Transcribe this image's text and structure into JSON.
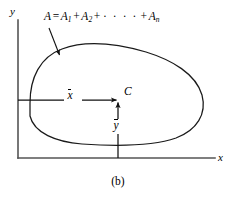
{
  "figure": {
    "caption": "(b)",
    "axes": {
      "y_label": "y",
      "x_label": "x",
      "origin_x": 18,
      "origin_y": 158,
      "y_top": 20,
      "x_right": 215
    },
    "formula": {
      "lhs": "A",
      "equals": "=",
      "term1": "A",
      "term1_sub": "1",
      "plus1": "+",
      "term2": "A",
      "term2_sub": "2",
      "plus2": "+",
      "ellipsis": "· · · ·",
      "plus3": "+",
      "termn": "A",
      "termn_sub": "n"
    },
    "centroid": {
      "point_label": "C",
      "x_distance_label": "x",
      "y_distance_label": "y",
      "point_x": 118,
      "point_y": 100
    },
    "colors": {
      "stroke": "#1a1a1a",
      "axis": "#4a4a4a",
      "background": "#ffffff",
      "text": "#000000"
    }
  }
}
